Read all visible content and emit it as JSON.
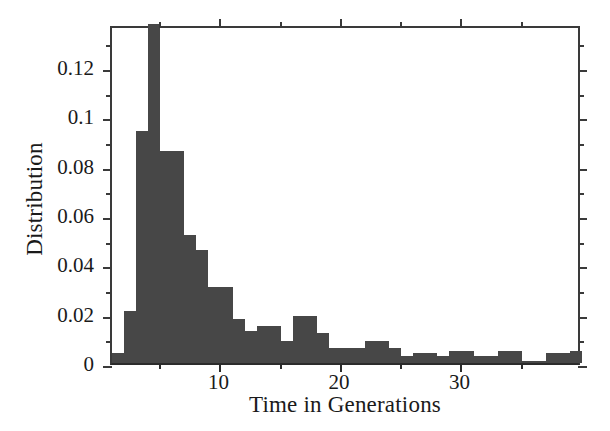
{
  "chart_data": {
    "type": "bar",
    "title": "",
    "subtitle": "",
    "xlabel": "Time in Generations",
    "ylabel": "Distribution",
    "xlim": [
      1,
      40
    ],
    "ylim": [
      0,
      0.1375
    ],
    "bin_width": 1,
    "grid": false,
    "legend": null,
    "bar_color": "#474747",
    "axis_color": "#2b2b2b",
    "xticks": [
      10,
      20,
      30
    ],
    "xtick_labels": [
      "10",
      "20",
      "30"
    ],
    "xminor_step": 5,
    "yticks": [
      0,
      0.02,
      0.04,
      0.06,
      0.08,
      0.1,
      0.12
    ],
    "ytick_labels": [
      "0",
      "0.02",
      "0.04",
      "0.06",
      "0.08",
      "0.1",
      "0.12"
    ],
    "yminor_step": 0.01,
    "categories": [
      1,
      2,
      3,
      4,
      5,
      6,
      7,
      8,
      9,
      10,
      11,
      12,
      13,
      14,
      15,
      16,
      17,
      18,
      19,
      20,
      21,
      22,
      23,
      24,
      25,
      26,
      27,
      28,
      29,
      30,
      31,
      32,
      33,
      34,
      35,
      36,
      37,
      38,
      39
    ],
    "values": [
      0.004,
      0.021,
      0.094,
      0.1375,
      0.086,
      0.086,
      0.052,
      0.046,
      0.031,
      0.031,
      0.018,
      0.013,
      0.015,
      0.015,
      0.009,
      0.019,
      0.019,
      0.012,
      0.006,
      0.006,
      0.006,
      0.009,
      0.009,
      0.006,
      0.003,
      0.004,
      0.004,
      0.003,
      0.005,
      0.005,
      0.003,
      0.003,
      0.005,
      0.005,
      0.001,
      0.001,
      0.004,
      0.004,
      0.005
    ]
  }
}
